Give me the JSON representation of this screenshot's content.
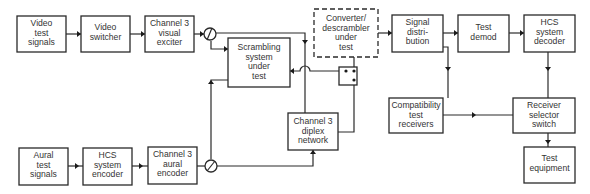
{
  "diagram": {
    "type": "block-diagram",
    "blocks": {
      "video_test_signals": {
        "lines": [
          "Video",
          "test",
          "signals"
        ]
      },
      "video_switcher": {
        "lines": [
          "Video",
          "switcher"
        ]
      },
      "visual_exciter": {
        "lines": [
          "Channel 3",
          "visual",
          "exciter"
        ]
      },
      "scrambling_system": {
        "lines": [
          "Scrambling",
          "system",
          "under",
          "test"
        ]
      },
      "converter_descrambler": {
        "lines": [
          "Converter/",
          "descrambler",
          "under",
          "test"
        ],
        "style": "dashed"
      },
      "signal_distribution": {
        "lines": [
          "Signal",
          "distri-",
          "bution"
        ]
      },
      "test_demod": {
        "lines": [
          "Test",
          "demod"
        ]
      },
      "hcs_decoder": {
        "lines": [
          "HCS",
          "system",
          "decoder"
        ]
      },
      "compatibility_receivers": {
        "lines": [
          "Compatibility",
          "test",
          "receivers"
        ]
      },
      "receiver_selector": {
        "lines": [
          "Receiver",
          "selector",
          "switch"
        ]
      },
      "test_equipment": {
        "lines": [
          "Test",
          "equipment"
        ]
      },
      "diplex_network": {
        "lines": [
          "Channel 3",
          "diplex",
          "network"
        ]
      },
      "aural_test_signals": {
        "lines": [
          "Aural",
          "test",
          "signals"
        ]
      },
      "hcs_encoder": {
        "lines": [
          "HCS",
          "system",
          "encoder"
        ]
      },
      "aural_encoder": {
        "lines": [
          "Channel 3",
          "aural",
          "encoder"
        ]
      }
    },
    "connections": [
      [
        "Video test signals",
        "Video switcher"
      ],
      [
        "Video switcher",
        "Channel 3 visual exciter"
      ],
      [
        "Channel 3 visual exciter",
        "Visual splitter"
      ],
      [
        "Visual splitter",
        "Scrambling system under test"
      ],
      [
        "Visual splitter",
        "Channel 3 diplex network"
      ],
      [
        "Aural test signals",
        "HCS system encoder"
      ],
      [
        "HCS system encoder",
        "Channel 3 aural encoder"
      ],
      [
        "Channel 3 aural encoder",
        "Aural splitter"
      ],
      [
        "Aural splitter",
        "Scrambling system under test"
      ],
      [
        "Aural splitter",
        "Channel 3 diplex network"
      ],
      [
        "Scrambling system under test",
        "Bypass switch"
      ],
      [
        "Channel 3 diplex network",
        "Bypass switch"
      ],
      [
        "Bypass switch",
        "Converter/descrambler under test"
      ],
      [
        "Converter/descrambler under test",
        "Signal distribution"
      ],
      [
        "Signal distribution",
        "Test demod"
      ],
      [
        "Test demod",
        "HCS system decoder"
      ],
      [
        "Signal distribution",
        "Compatibility test receivers"
      ],
      [
        "HCS system decoder",
        "Receiver selector switch"
      ],
      [
        "Compatibility test receivers",
        "Receiver selector switch"
      ],
      [
        "Receiver selector switch",
        "Test equipment"
      ]
    ]
  }
}
